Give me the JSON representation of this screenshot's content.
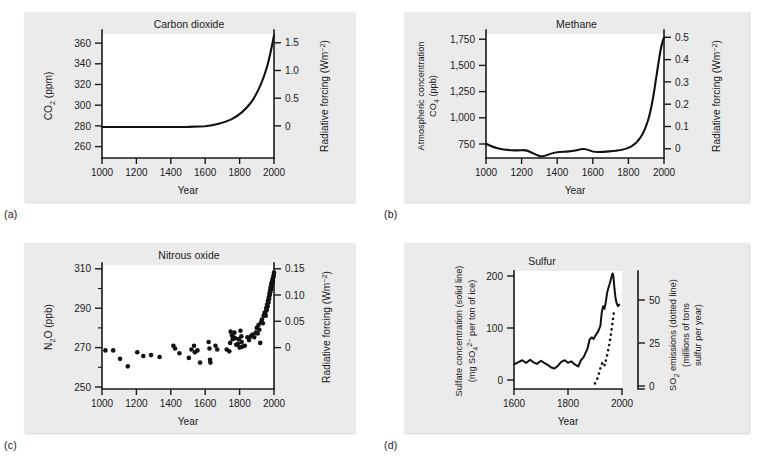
{
  "figure": {
    "panels": [
      {
        "tag": "(a)",
        "title": "Carbon dioxide",
        "x_label": "Year",
        "y_left_label_main": "CO",
        "y_left_label_sub": "2",
        "y_left_label_tail": " (ppm)",
        "y_right_label_main": "Radiative forcing (Wm",
        "y_right_label_sup": "−2",
        "y_right_label_tail": ")",
        "x_ticks": [
          "1000",
          "1200",
          "1400",
          "1600",
          "1800",
          "2000"
        ],
        "y_left_ticks": [
          "260",
          "280",
          "300",
          "320",
          "340",
          "360"
        ],
        "y_right_ticks": [
          "0",
          "0.5",
          "1.0",
          "1.5"
        ]
      },
      {
        "tag": "(b)",
        "title": "Methane",
        "x_label": "Year",
        "y_left_label_line1": "Atmospheric concentration",
        "y_left_label_main": "CO",
        "y_left_label_sub": "4",
        "y_left_label_tail": " (ppb)",
        "y_right_label_main": "Radiative forcing (Wm",
        "y_right_label_sup": "−2",
        "y_right_label_tail": ")",
        "x_ticks": [
          "1000",
          "1200",
          "1400",
          "1600",
          "1800",
          "2000"
        ],
        "y_left_ticks": [
          "750",
          "1,000",
          "1,250",
          "1,500",
          "1,750"
        ],
        "y_right_ticks": [
          "0",
          "0.1",
          "0.2",
          "0.3",
          "0.4",
          "0.5"
        ]
      },
      {
        "tag": "(c)",
        "title": "Nitrous oxide",
        "x_label": "Year",
        "y_left_label_main": "N",
        "y_left_label_sub": "2",
        "y_left_label_tail": "O (ppb)",
        "y_right_label_main": "Radiative forcing (Wm",
        "y_right_label_sup": "−2",
        "y_right_label_tail": ")",
        "x_ticks": [
          "1000",
          "1200",
          "1400",
          "1600",
          "1800",
          "2000"
        ],
        "y_left_ticks": [
          "250",
          "270",
          "290",
          "310"
        ],
        "y_right_ticks": [
          "0",
          "0.05",
          "0.10",
          "0.15"
        ]
      },
      {
        "tag": "(d)",
        "title": "Sulfur",
        "x_label": "Year",
        "y_left_label_line1": "Sulfate concentration (solid line)",
        "y_left_label_line2_a": "(mg SO",
        "y_left_label_line2_sub": "4",
        "y_left_label_line2_sup": "2−",
        "y_left_label_line2_b": " per ton of ice)",
        "y_right_label_line1_a": "SO",
        "y_right_label_line1_sub": "2",
        "y_right_label_line1_b": " emissions (dotted line)",
        "y_right_label_line2": "(millions of tons",
        "y_right_label_line3": "sulfur per year)",
        "x_ticks": [
          "1600",
          "1800",
          "2000"
        ],
        "y_left_ticks": [
          "0",
          "100",
          "200"
        ],
        "y_right_ticks": [
          "0",
          "25",
          "50"
        ]
      }
    ]
  },
  "chart_data": [
    {
      "type": "line",
      "panel": "(a)",
      "title": "Carbon dioxide",
      "xlabel": "Year",
      "ylabel": "CO2 (ppm)",
      "y2label": "Radiative forcing (Wm-2)",
      "xlim": [
        1000,
        2000
      ],
      "ylim": [
        248,
        368
      ],
      "y2lim": [
        -0.16,
        1.5
      ],
      "y2_zero_at_y": 280,
      "grid": false,
      "legend": "none",
      "x": [
        1000,
        1100,
        1200,
        1300,
        1400,
        1500,
        1600,
        1700,
        1750,
        1800,
        1850,
        1880,
        1900,
        1920,
        1940,
        1950,
        1960,
        1970,
        1980,
        1990,
        1995,
        2000
      ],
      "values": [
        276,
        276,
        276,
        276,
        276,
        276,
        276,
        277,
        278,
        282,
        285,
        291,
        296,
        303,
        311,
        313,
        317,
        325,
        339,
        354,
        361,
        368
      ]
    },
    {
      "type": "line",
      "panel": "(b)",
      "title": "Methane",
      "xlabel": "Year",
      "ylabel": "Atmospheric concentration CO4 (ppb)",
      "y2label": "Radiative forcing (Wm-2)",
      "xlim": [
        1000,
        2000
      ],
      "ylim": [
        620,
        1800
      ],
      "y2lim": [
        -0.04,
        0.52
      ],
      "y2_zero_at_y": 700,
      "grid": false,
      "legend": "none",
      "x": [
        1000,
        1050,
        1100,
        1150,
        1200,
        1250,
        1270,
        1300,
        1350,
        1400,
        1450,
        1500,
        1550,
        1600,
        1650,
        1700,
        1750,
        1800,
        1850,
        1880,
        1900,
        1920,
        1940,
        1950,
        1960,
        1970,
        1980,
        1990,
        2000
      ],
      "values": [
        752,
        735,
        722,
        718,
        720,
        690,
        668,
        672,
        686,
        690,
        690,
        692,
        712,
        700,
        694,
        696,
        700,
        705,
        730,
        780,
        850,
        930,
        1060,
        1150,
        1250,
        1380,
        1530,
        1640,
        1690
      ]
    },
    {
      "type": "scatter",
      "panel": "(c)",
      "title": "Nitrous oxide",
      "xlabel": "Year",
      "ylabel": "N2O (ppb)",
      "y2label": "Radiative forcing (Wm-2)",
      "xlim": [
        1000,
        2000
      ],
      "ylim": [
        250,
        313
      ],
      "y2lim": [
        -0.012,
        0.152
      ],
      "y2_zero_at_y": 270,
      "grid": false,
      "legend": "none",
      "points": [
        [
          1020,
          269.5
        ],
        [
          1065,
          269.5
        ],
        [
          1105,
          265.0
        ],
        [
          1150,
          261.0
        ],
        [
          1205,
          268.5
        ],
        [
          1240,
          266.5
        ],
        [
          1285,
          267.0
        ],
        [
          1335,
          266.0
        ],
        [
          1415,
          272.0
        ],
        [
          1425,
          270.5
        ],
        [
          1450,
          268.0
        ],
        [
          1505,
          265.5
        ],
        [
          1520,
          270.0
        ],
        [
          1535,
          272.0
        ],
        [
          1540,
          268.5
        ],
        [
          1555,
          269.5
        ],
        [
          1570,
          263.0
        ],
        [
          1620,
          274.0
        ],
        [
          1625,
          270.5
        ],
        [
          1628,
          264.5
        ],
        [
          1630,
          263.0
        ],
        [
          1660,
          272.0
        ],
        [
          1670,
          270.0
        ],
        [
          1725,
          270.0
        ],
        [
          1740,
          269.0
        ],
        [
          1745,
          273.5
        ],
        [
          1748,
          279.5
        ],
        [
          1755,
          277.5
        ],
        [
          1760,
          275.5
        ],
        [
          1765,
          276.5
        ],
        [
          1770,
          279.0
        ],
        [
          1775,
          276.0
        ],
        [
          1780,
          272.5
        ],
        [
          1790,
          273.0
        ],
        [
          1795,
          275.5
        ],
        [
          1800,
          271.0
        ],
        [
          1805,
          280.0
        ],
        [
          1810,
          277.0
        ],
        [
          1812,
          274.0
        ],
        [
          1815,
          271.5
        ],
        [
          1830,
          272.0
        ],
        [
          1845,
          276.5
        ],
        [
          1855,
          275.0
        ],
        [
          1865,
          277.0
        ],
        [
          1875,
          278.0
        ],
        [
          1885,
          276.5
        ],
        [
          1895,
          279.0
        ],
        [
          1900,
          281.5
        ],
        [
          1905,
          278.5
        ],
        [
          1910,
          283.0
        ],
        [
          1915,
          280.5
        ],
        [
          1920,
          273.5
        ],
        [
          1925,
          284.5
        ],
        [
          1930,
          286.0
        ],
        [
          1935,
          284.0
        ],
        [
          1940,
          288.0
        ],
        [
          1945,
          289.5
        ],
        [
          1950,
          290.0
        ],
        [
          1952,
          288.0
        ],
        [
          1955,
          292.0
        ],
        [
          1958,
          291.0
        ],
        [
          1960,
          294.0
        ],
        [
          1963,
          293.0
        ],
        [
          1965,
          296.0
        ],
        [
          1968,
          295.0
        ],
        [
          1970,
          298.0
        ],
        [
          1972,
          297.0
        ],
        [
          1974,
          300.0
        ],
        [
          1976,
          299.0
        ],
        [
          1978,
          301.5
        ],
        [
          1980,
          303.0
        ],
        [
          1982,
          302.0
        ],
        [
          1984,
          304.5
        ],
        [
          1986,
          305.5
        ],
        [
          1988,
          304.0
        ],
        [
          1990,
          306.5
        ],
        [
          1992,
          307.5
        ],
        [
          1994,
          306.0
        ],
        [
          1996,
          308.5
        ],
        [
          1998,
          309.5
        ],
        [
          2000,
          311.0
        ],
        [
          1985,
          303.0
        ],
        [
          1978,
          300.5
        ],
        [
          1968,
          296.5
        ],
        [
          1958,
          292.5
        ],
        [
          1948,
          289.0
        ]
      ]
    },
    {
      "type": "line",
      "panel": "(d)",
      "title": "Sulfur",
      "xlabel": "Year",
      "ylabel": "Sulfate concentration (solid line) (mg SO4 2- per ton of ice)",
      "y2label": "SO2 emissions (dotted line) (millions of tons sulfur per year)",
      "xlim": [
        1600,
        2000
      ],
      "ylim": [
        -12,
        215
      ],
      "y2lim": [
        0,
        57
      ],
      "grid": false,
      "legend": "none",
      "series": [
        {
          "name": "Sulfate concentration (solid line)",
          "x": [
            1600,
            1615,
            1630,
            1645,
            1660,
            1672,
            1685,
            1700,
            1712,
            1725,
            1738,
            1750,
            1762,
            1775,
            1788,
            1800,
            1812,
            1825,
            1838,
            1848,
            1858,
            1865,
            1872,
            1880,
            1888,
            1895,
            1900,
            1905,
            1910,
            1915,
            1920,
            1925,
            1930,
            1935,
            1940,
            1945,
            1950,
            1955,
            1960,
            1965,
            1968,
            1972,
            1976,
            1980,
            1985,
            1990
          ],
          "values": [
            30,
            34,
            38,
            33,
            39,
            34,
            31,
            37,
            33,
            29,
            24,
            22,
            27,
            35,
            38,
            33,
            36,
            30,
            26,
            38,
            44,
            52,
            60,
            78,
            82,
            79,
            84,
            88,
            92,
            98,
            104,
            130,
            142,
            137,
            150,
            168,
            178,
            186,
            196,
            205,
            200,
            176,
            158,
            148,
            142,
            145
          ]
        },
        {
          "name": "SO2 emissions (dotted line)",
          "x": [
            1900,
            1908,
            1916,
            1924,
            1930,
            1936,
            1942,
            1948,
            1954,
            1960,
            1966,
            1970
          ],
          "values": [
            1.5,
            4.0,
            8.0,
            12.5,
            14.0,
            12.0,
            16.0,
            20.0,
            25.0,
            31.0,
            38.0,
            43.0
          ]
        }
      ]
    }
  ]
}
